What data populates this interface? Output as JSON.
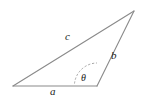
{
  "figure": {
    "kind": "oblique-triangle-diagram",
    "background_color": "#ffffff",
    "stroke_color": "#8a8a8a",
    "arc_color": "#9a9a9a",
    "label_color": "#1a1a1a",
    "vertices": {
      "left": {
        "x": 13,
        "y": 86
      },
      "bottom_right": {
        "x": 97,
        "y": 86
      },
      "apex": {
        "x": 134,
        "y": 11
      }
    },
    "sides": [
      {
        "id": "a",
        "label": "a",
        "from": "left",
        "to": "bottom_right",
        "label_x": 50,
        "label_y": 86
      },
      {
        "id": "b",
        "label": "b",
        "from": "bottom_right",
        "to": "apex",
        "label_x": 111,
        "label_y": 50
      },
      {
        "id": "c",
        "label": "c",
        "from": "left",
        "to": "apex",
        "label_x": 65,
        "label_y": 31
      }
    ],
    "angle": {
      "id": "theta",
      "label": "θ",
      "at_vertex": "bottom_right",
      "style": "dashed-arc",
      "label_x": 81,
      "label_y": 73,
      "arc_path": "M 74.5 83.5 A 23 23 0 0 1 97 63",
      "arc_dash": "2.2 1.8"
    }
  }
}
